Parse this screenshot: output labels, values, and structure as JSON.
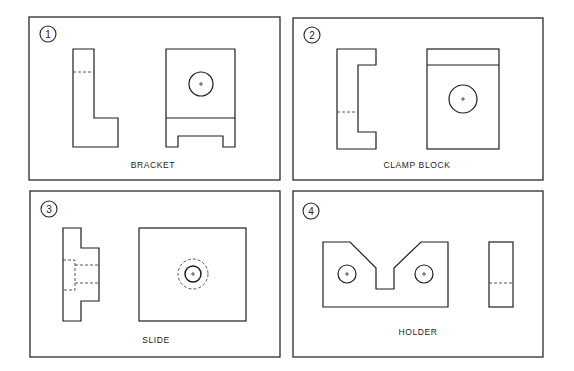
{
  "figure": {
    "panels": [
      {
        "number": "1",
        "name": "BRACKET"
      },
      {
        "number": "2",
        "name": "CLAMP BLOCK"
      },
      {
        "number": "3",
        "name": "SLIDE"
      },
      {
        "number": "4",
        "name": "HOLDER"
      }
    ]
  },
  "colors": {
    "line": "#1e1e1e",
    "background": "#ffffff"
  }
}
